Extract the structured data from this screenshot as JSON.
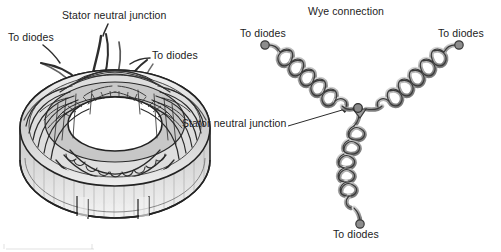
{
  "figure": {
    "background_color": "#ffffff",
    "ink_color": "#1c1c1c",
    "coil_fill_color": "#b4b4b4",
    "coil_stroke_color": "#3a3a3a"
  },
  "left_diagram": {
    "name": "stator-assembly-illustration",
    "subject": "alternator stator with windings and lead wires",
    "labels": {
      "neutral_junction": "Stator neutral junction",
      "to_diodes_left": "To diodes",
      "to_diodes_right": "To diodes"
    },
    "lead_wire_count": 4
  },
  "right_diagram": {
    "name": "wye-connection-schematic",
    "title": "Wye connection",
    "labels": {
      "to_diodes_upper_left": "To diodes",
      "to_diodes_upper_right": "To diodes",
      "to_diodes_bottom": "To diodes",
      "neutral_junction": "Stator neutral junction"
    },
    "coil_arm_count": 3,
    "terminal_count": 3
  }
}
